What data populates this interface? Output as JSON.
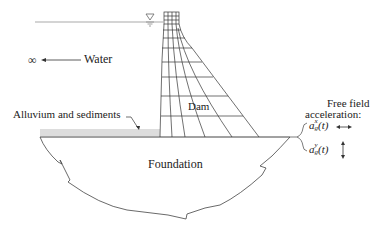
{
  "diagram": {
    "labels": {
      "water": "Water",
      "infinity": "∞",
      "alluvium": "Alluvium and sediments",
      "dam": "Dam",
      "foundation": "Foundation",
      "free_field_line1": "Free field",
      "free_field_line2": "acceleration:",
      "accel_x": "a",
      "accel_x_sup": "x",
      "accel_x_sub": "g",
      "accel_x_arg": "(t)",
      "accel_y": "a",
      "accel_y_sup": "y",
      "accel_y_sub": "g",
      "accel_y_arg": "(t)"
    },
    "symbols": {
      "water_level": "free-surface-triangle",
      "horizontal_motion": "double-arrow-horizontal",
      "vertical_motion": "double-arrow-vertical"
    },
    "colors": {
      "line": "#333333",
      "water_line": "#aaaaaa",
      "sediment": "#d8d8d8",
      "background": "#ffffff"
    }
  }
}
